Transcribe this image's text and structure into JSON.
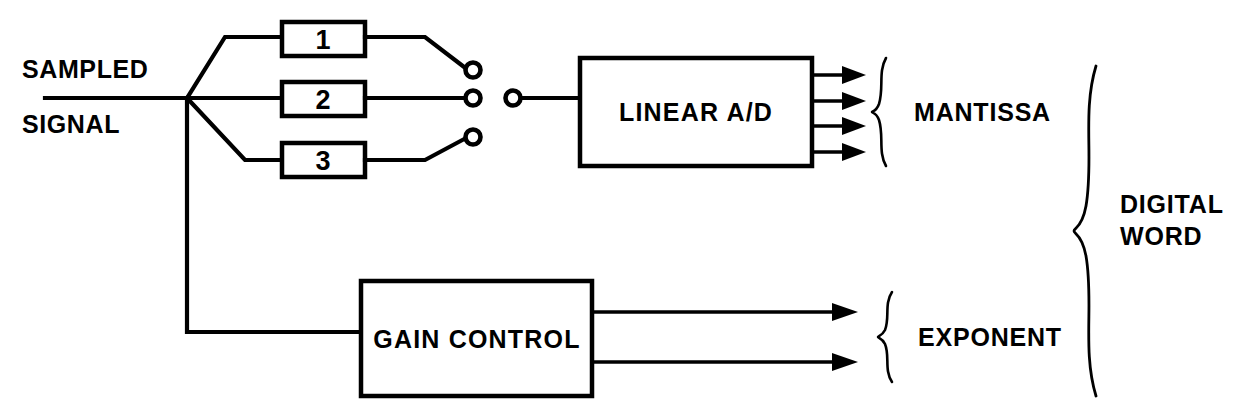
{
  "diagram": {
    "ink_color": "#000000",
    "background_color": "#ffffff",
    "input": {
      "line1": "SAMPLED",
      "line2": "SIGNAL"
    },
    "amplifiers": [
      {
        "label": "1"
      },
      {
        "label": "2"
      },
      {
        "label": "3"
      }
    ],
    "blocks": {
      "adc": "LINEAR A/D",
      "gain": "GAIN CONTROL"
    },
    "outputs": {
      "mantissa": "MANTISSA",
      "exponent": "EXPONENT",
      "digital_word_line1": "DIGITAL",
      "digital_word_line2": "WORD"
    },
    "bit_counts": {
      "mantissa_lines": 4,
      "exponent_lines": 2
    }
  }
}
